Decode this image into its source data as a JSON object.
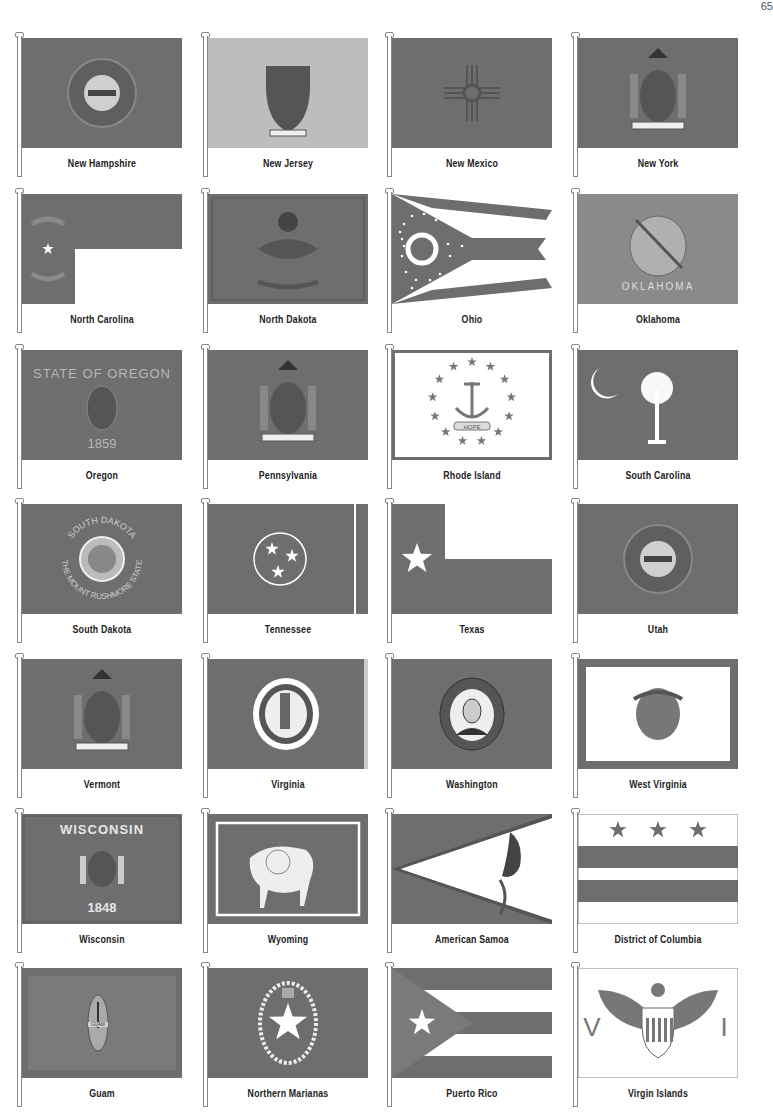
{
  "page": {
    "number": "65"
  },
  "colors": {
    "flag_gray": "#6e6e6e",
    "light_gray": "#bdbdbd",
    "white": "#ffffff",
    "text": "#222222"
  },
  "flags": [
    {
      "name": "New Hampshire",
      "style": "seal",
      "text": ""
    },
    {
      "name": "New Jersey",
      "style": "seal-light",
      "text": ""
    },
    {
      "name": "New Mexico",
      "style": "zia",
      "text": ""
    },
    {
      "name": "New York",
      "style": "arms",
      "text": "EXCELSIOR"
    },
    {
      "name": "North Carolina",
      "style": "nc",
      "text": "N ★ C"
    },
    {
      "name": "North Dakota",
      "style": "eagle",
      "text": ""
    },
    {
      "name": "Ohio",
      "style": "burgee",
      "text": ""
    },
    {
      "name": "Oklahoma",
      "style": "shield",
      "text": "OKLAHOMA"
    },
    {
      "name": "Oregon",
      "style": "oregon",
      "text_top": "STATE OF OREGON",
      "text_bottom": "1859"
    },
    {
      "name": "Pennsylvania",
      "style": "arms",
      "text": ""
    },
    {
      "name": "Rhode Island",
      "style": "anchor",
      "text": "HOPE"
    },
    {
      "name": "South Carolina",
      "style": "palmetto",
      "text": ""
    },
    {
      "name": "South Dakota",
      "style": "sd",
      "text_top": "SOUTH DAKOTA",
      "text_bottom": "THE MOUNT RUSHMORE STATE"
    },
    {
      "name": "Tennessee",
      "style": "tn",
      "text": ""
    },
    {
      "name": "Texas",
      "style": "tx",
      "text": ""
    },
    {
      "name": "Utah",
      "style": "seal",
      "text": ""
    },
    {
      "name": "Vermont",
      "style": "arms",
      "text": ""
    },
    {
      "name": "Virginia",
      "style": "va",
      "text": ""
    },
    {
      "name": "Washington",
      "style": "wa",
      "text": ""
    },
    {
      "name": "West Virginia",
      "style": "wv",
      "text": ""
    },
    {
      "name": "Wisconsin",
      "style": "wi",
      "text_top": "WISCONSIN",
      "text_bottom": "1848"
    },
    {
      "name": "Wyoming",
      "style": "wy",
      "text": ""
    },
    {
      "name": "American Samoa",
      "style": "as",
      "text": ""
    },
    {
      "name": "District of Columbia",
      "style": "dc",
      "text": ""
    },
    {
      "name": "Guam",
      "style": "gu",
      "text": "GUAM"
    },
    {
      "name": "Northern Marianas",
      "style": "mp",
      "text": ""
    },
    {
      "name": "Puerto Rico",
      "style": "pr",
      "text": ""
    },
    {
      "name": "Virgin Islands",
      "style": "vi",
      "text_left": "V",
      "text_right": "I"
    }
  ]
}
